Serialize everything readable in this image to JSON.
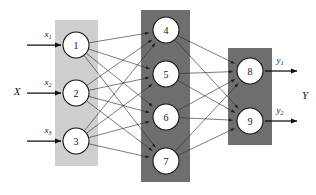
{
  "figure": {
    "width": 316,
    "height": 195,
    "background": "#ffffff"
  },
  "colors": {
    "input_panel": "#cfcfcf",
    "hidden_panel": "#6e6e6e",
    "output_panel": "#6e6e6e",
    "node_fill": "#ffffff",
    "node_stroke": "#141414",
    "edge": "#2b2b2b",
    "arrow": "#0d0d0d",
    "text": "#111111"
  },
  "labels": {
    "input_group": "X",
    "output_group": "Y",
    "inputs": [
      {
        "base": "x",
        "sub": "1"
      },
      {
        "base": "x",
        "sub": "2"
      },
      {
        "base": "x",
        "sub": "3"
      }
    ],
    "outputs": [
      {
        "base": "y",
        "sub": "1"
      },
      {
        "base": "y",
        "sub": "2"
      }
    ]
  },
  "layers": [
    {
      "name": "input-layer",
      "panel": {
        "x": 55,
        "y": 20,
        "width": 43,
        "height": 146,
        "fill": "#cfcfcf"
      },
      "nodes": [
        {
          "id": "1",
          "cx": 76,
          "cy": 45,
          "r": 13
        },
        {
          "id": "2",
          "cx": 76,
          "cy": 93,
          "r": 13
        },
        {
          "id": "3",
          "cx": 76,
          "cy": 141,
          "r": 13
        }
      ]
    },
    {
      "name": "hidden-layer",
      "panel": {
        "x": 141,
        "y": 10,
        "width": 49,
        "height": 172,
        "fill": "#6e6e6e"
      },
      "nodes": [
        {
          "id": "4",
          "cx": 166,
          "cy": 30,
          "r": 13
        },
        {
          "id": "5",
          "cx": 166,
          "cy": 74,
          "r": 13
        },
        {
          "id": "6",
          "cx": 166,
          "cy": 117,
          "r": 13
        },
        {
          "id": "7",
          "cx": 166,
          "cy": 161,
          "r": 13
        }
      ]
    },
    {
      "name": "output-layer",
      "panel": {
        "x": 228,
        "y": 48,
        "width": 44,
        "height": 97,
        "fill": "#6e6e6e"
      },
      "nodes": [
        {
          "id": "8",
          "cx": 250,
          "cy": 71,
          "r": 13
        },
        {
          "id": "9",
          "cx": 250,
          "cy": 121,
          "r": 13
        }
      ]
    }
  ],
  "connections": {
    "input_to_hidden": [
      [
        "1",
        "4"
      ],
      [
        "1",
        "5"
      ],
      [
        "1",
        "6"
      ],
      [
        "1",
        "7"
      ],
      [
        "2",
        "4"
      ],
      [
        "2",
        "5"
      ],
      [
        "2",
        "6"
      ],
      [
        "2",
        "7"
      ],
      [
        "3",
        "4"
      ],
      [
        "3",
        "5"
      ],
      [
        "3",
        "6"
      ],
      [
        "3",
        "7"
      ]
    ],
    "hidden_to_output": [
      [
        "4",
        "8"
      ],
      [
        "4",
        "9"
      ],
      [
        "5",
        "8"
      ],
      [
        "5",
        "9"
      ],
      [
        "6",
        "8"
      ],
      [
        "6",
        "9"
      ],
      [
        "7",
        "8"
      ],
      [
        "7",
        "9"
      ]
    ]
  },
  "io_arrows": {
    "inputs": [
      {
        "label": "x1",
        "x1": 27,
        "x2": 61,
        "y": 45,
        "label_x": 48,
        "label_y": 37
      },
      {
        "label": "x2",
        "x1": 27,
        "x2": 61,
        "y": 93,
        "label_x": 48,
        "label_y": 85
      },
      {
        "label": "x3",
        "x1": 27,
        "x2": 61,
        "y": 141,
        "label_x": 48,
        "label_y": 133
      }
    ],
    "outputs": [
      {
        "label": "y1",
        "x1": 265,
        "x2": 297,
        "y": 71,
        "label_x": 280,
        "label_y": 63
      },
      {
        "label": "y2",
        "x1": 265,
        "x2": 297,
        "y": 121,
        "label_x": 280,
        "label_y": 113
      }
    ]
  },
  "group_labels": [
    {
      "name": "input-group-label",
      "text": "X",
      "x": 17,
      "y": 91
    },
    {
      "name": "output-group-label",
      "text": "Y",
      "x": 305,
      "y": 95
    }
  ]
}
